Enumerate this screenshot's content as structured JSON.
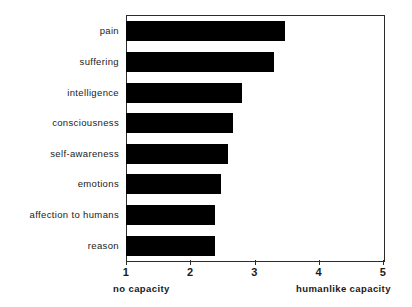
{
  "chart_data": {
    "type": "bar",
    "orientation": "horizontal",
    "title": "",
    "subtitle": "",
    "xlabel": "",
    "ylabel": "",
    "xlim": [
      1,
      5
    ],
    "ylim": null,
    "grid": false,
    "legend": null,
    "bar_color": "#000000",
    "axis_color": "#2b2b2b",
    "background": "#ffffff",
    "categories": [
      "pain",
      "suffering",
      "intelligence",
      "consciousness",
      "self-awareness",
      "emotions",
      "affection to humans",
      "reason"
    ],
    "values": [
      3.48,
      3.31,
      2.8,
      2.66,
      2.59,
      2.48,
      2.38,
      2.39
    ],
    "xticks": [
      1,
      2,
      3,
      4,
      5
    ],
    "xtick_labels": [
      "1",
      "2",
      "3",
      "4",
      "5"
    ],
    "annotations": {
      "scale_low": "no capacity",
      "scale_high": "humanlike capacity"
    }
  }
}
